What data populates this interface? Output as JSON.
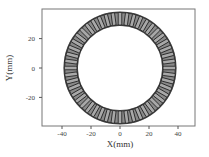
{
  "chart_data": {
    "type": "scatter",
    "title": "",
    "xlabel": "X(mm)",
    "ylabel": "Y(mm)",
    "xlim": [
      -54,
      52
    ],
    "ylim": [
      -40,
      40
    ],
    "xticks": [
      -40,
      -20,
      0,
      20,
      40
    ],
    "yticks": [
      20,
      0,
      -20
    ],
    "xtick_labels": [
      "-40",
      "-20",
      "0",
      "20",
      "40"
    ],
    "ytick_labels": [
      "20",
      "0",
      "-20"
    ],
    "grid": false,
    "legend": null,
    "ring": {
      "center": [
        0,
        0
      ],
      "inner_radius_mm": 29,
      "outer_radius_mm": 39,
      "segment_count": 48,
      "description": "Circular ring of coil segments (annulus of rectangular windings)"
    },
    "colors": {
      "ring_fill": "#8a8a8a",
      "segment_stroke": "#1e1e1e",
      "axis": "#555555"
    }
  }
}
